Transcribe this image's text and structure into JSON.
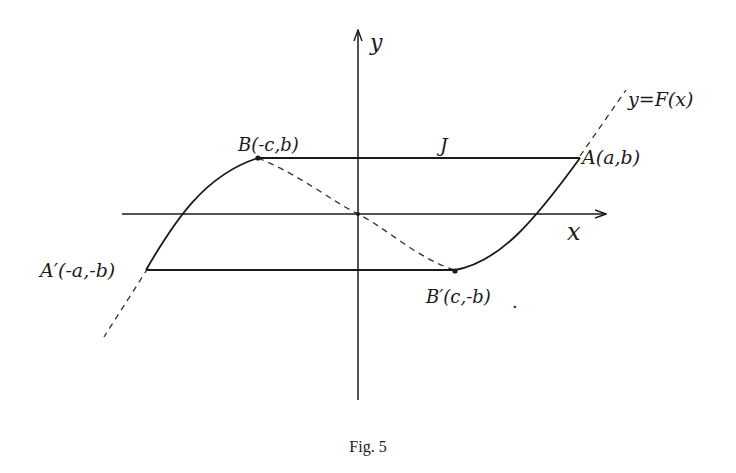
{
  "figure": {
    "caption": "Fig. 5",
    "axes": {
      "x_label": "x",
      "y_label": "y"
    },
    "curve_label": "y=F(x)",
    "segment_label": "J",
    "points": {
      "A": "A(a,b)",
      "B": "B(-c,b)",
      "A_prime": "A′(-a,-b)",
      "B_prime": "B′(c,-b)"
    },
    "trailing_mark": "."
  },
  "colors": {
    "ink": "#1a1a1a",
    "background": "#ffffff"
  }
}
